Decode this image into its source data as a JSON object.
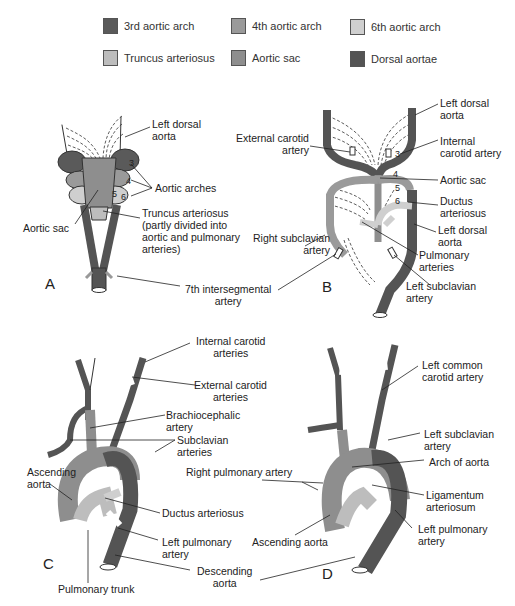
{
  "legend": [
    {
      "label": "3rd aortic arch",
      "color": "#5a5a5a"
    },
    {
      "label": "4th aortic arch",
      "color": "#9a9a9a"
    },
    {
      "label": "6th aortic arch",
      "color": "#cfcfcf"
    },
    {
      "label": "Truncus arteriosus",
      "color": "#bdbdbd"
    },
    {
      "label": "Aortic sac",
      "color": "#8e8e8e"
    },
    {
      "label": "Dorsal aortae",
      "color": "#545454"
    }
  ],
  "colors": {
    "arch3": "#5a5a5a",
    "arch4": "#9a9a9a",
    "arch6": "#cfcfcf",
    "truncus": "#bdbdbd",
    "aortic_sac": "#8e8e8e",
    "dorsal_aortae": "#545454",
    "outline": "#333333"
  },
  "panels": {
    "A": {
      "letter": "A",
      "labels": {
        "left_dorsal_aorta": "Left dorsal\naorta",
        "aortic_arches": "Aortic arches",
        "aortic_sac": "Aortic sac",
        "truncus": "Truncus arteriosus\n(partly divided into\naortic and pulmonary\narteries)",
        "seventh_intersegmental": "7th intersegmental\nartery",
        "arch_numbers": [
          "3",
          "4",
          "5",
          "6"
        ]
      }
    },
    "B": {
      "letter": "B",
      "labels": {
        "left_dorsal_aorta_top": "Left dorsal\naorta",
        "external_carotid": "External carotid\nartery",
        "internal_carotid": "Internal\ncarotid artery",
        "aortic_sac": "Aortic sac",
        "ductus": "Ductus\narteriosus",
        "left_dorsal_aorta": "Left dorsal\naorta",
        "right_subclavian": "Right subclavian\nartery",
        "pulmonary_arteries": "Pulmonary\narteries",
        "left_subclavian": "Left subclavian\nartery",
        "arch_numbers": [
          "3",
          "4",
          "5",
          "6"
        ]
      }
    },
    "C": {
      "letter": "C",
      "labels": {
        "internal_carotid": "Internal carotid\narteries",
        "external_carotid": "External carotid\narteries",
        "brachiocephalic": "Brachiocephalic\nartery",
        "subclavian": "Subclavian\narteries",
        "ascending_aorta": "Ascending\naorta",
        "ductus": "Ductus arteriosus",
        "left_pulmonary": "Left pulmonary\nartery",
        "pulmonary_trunk": "Pulmonary trunk",
        "descending_aorta": "Descending\naorta"
      }
    },
    "D": {
      "letter": "D",
      "labels": {
        "left_common_carotid": "Left common\ncarotid artery",
        "left_subclavian": "Left subclavian\nartery",
        "right_pulmonary": "Right pulmonary artery",
        "arch_of_aorta": "Arch of aorta",
        "ligamentum": "Ligamentum\narteriosum",
        "ascending_aorta": "Ascending aorta",
        "left_pulmonary": "Left pulmonary\nartery"
      }
    }
  }
}
